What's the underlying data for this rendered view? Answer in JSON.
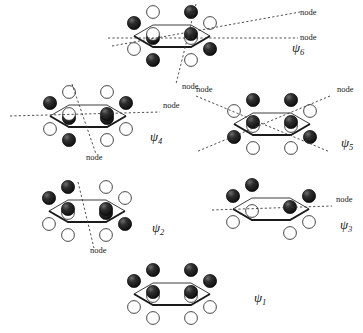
{
  "figure": {
    "node_label": "node",
    "colors": {
      "lobe_dark": "#1c1c1c",
      "lobe_light": "#ffffff",
      "ring": "#1a1a1a",
      "node_line": "#3a3a3a",
      "background": "#ffffff",
      "text": "#1a1a1a"
    }
  },
  "orbitals": [
    {
      "id": "psi6",
      "symbol": "ψ",
      "subscript": "6",
      "label_x": 292,
      "label_y": 52,
      "node_count": 3,
      "center_x": 172,
      "center_y": 36,
      "nodes": [
        {
          "label": "node",
          "label_x": 300,
          "label_y": 15
        },
        {
          "label": "node",
          "label_x": 300,
          "label_y": 40
        },
        {
          "label": "node",
          "label_x": 182,
          "label_y": 89
        }
      ],
      "phases_top": [
        "dark",
        "light",
        "dark",
        "light",
        "dark",
        "light"
      ]
    },
    {
      "id": "psi4",
      "symbol": "ψ",
      "subscript": "4",
      "label_x": 150,
      "label_y": 141,
      "node_count": 2,
      "center_x": 88,
      "center_y": 116,
      "nodes": [
        {
          "label": "node",
          "label_x": 163,
          "label_y": 108
        },
        {
          "label": "node",
          "label_x": 86,
          "label_y": 160
        }
      ],
      "phases_top": [
        "dark",
        "light",
        "light",
        "dark",
        "dark",
        "light"
      ]
    },
    {
      "id": "psi5",
      "symbol": "ψ",
      "subscript": "5",
      "label_x": 341,
      "label_y": 147,
      "node_count": 2,
      "center_x": 272,
      "center_y": 124,
      "nodes": [
        {
          "label": "node",
          "label_x": 337,
          "label_y": 92
        },
        {
          "label": "node",
          "label_x": 196,
          "label_y": 92
        }
      ],
      "phases_top": [
        "light",
        "dark",
        "dark",
        "light",
        "dark",
        "dark"
      ]
    },
    {
      "id": "psi2",
      "symbol": "ψ",
      "subscript": "2",
      "label_x": 152,
      "label_y": 232,
      "node_count": 1,
      "center_x": 87,
      "center_y": 211,
      "nodes": [
        {
          "label": "node",
          "label_x": 90,
          "label_y": 253
        }
      ],
      "phases_top": [
        "dark",
        "dark",
        "light",
        "light",
        "dark",
        "dark"
      ]
    },
    {
      "id": "psi3",
      "symbol": "ψ",
      "subscript": "3",
      "label_x": 340,
      "label_y": 229,
      "node_count": 1,
      "center_x": 271,
      "center_y": 209,
      "nodes": [
        {
          "label": "node",
          "label_x": 336,
          "label_y": 202
        }
      ],
      "phases_top": [
        "dark",
        "dark",
        "none",
        "dark",
        "dark",
        "none"
      ]
    },
    {
      "id": "psi1",
      "symbol": "ψ",
      "subscript": "1",
      "label_x": 254,
      "label_y": 302,
      "node_count": 0,
      "center_x": 172,
      "center_y": 294,
      "nodes": [],
      "phases_top": [
        "dark",
        "dark",
        "dark",
        "dark",
        "dark",
        "dark"
      ]
    }
  ]
}
